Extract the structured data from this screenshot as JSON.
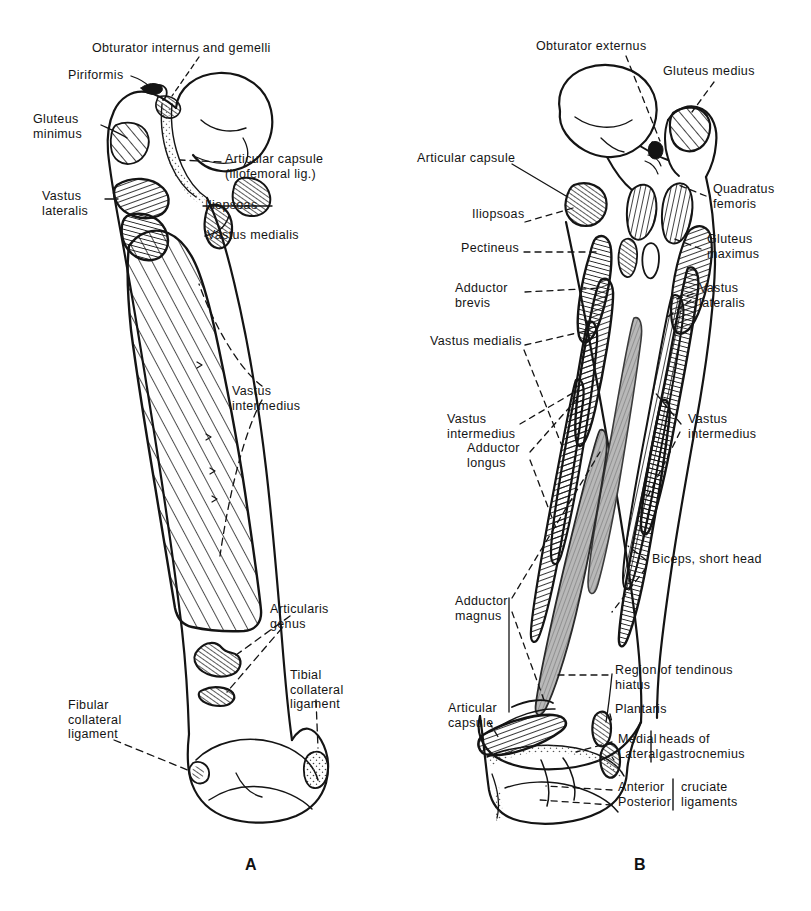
{
  "figure": {
    "panels": [
      {
        "id": "A",
        "label": "A",
        "view": "anterior"
      },
      {
        "id": "B",
        "label": "B",
        "view": "posterior"
      }
    ]
  },
  "panel_a": {
    "label": "A",
    "labels": [
      {
        "name": "obturator-internus-and-gemelli",
        "text": "Obturator internus and gemelli",
        "x": 92,
        "y": 47,
        "align": "left"
      },
      {
        "name": "piriformis",
        "text": "Piriformis",
        "x": 68,
        "y": 74,
        "align": "left"
      },
      {
        "name": "gluteus-minimus",
        "text": "Gluteus\nminimus",
        "x": 33,
        "y": 118,
        "align": "left"
      },
      {
        "name": "articular-capsule-iliofemoral",
        "text": "Articular capsule\n(iliofemoral lig.)",
        "x": 225,
        "y": 158,
        "align": "left"
      },
      {
        "name": "vastus-lateralis",
        "text": "Vastus\nlateralis",
        "x": 42,
        "y": 193,
        "align": "left"
      },
      {
        "name": "iliopsoas",
        "text": "Iliopsoas",
        "x": 205,
        "y": 202,
        "align": "left"
      },
      {
        "name": "vastus-medialis",
        "text": "Vastus medialis",
        "x": 207,
        "y": 232,
        "align": "left"
      },
      {
        "name": "vastus-intermedius",
        "text": "Vastus\nintermedius",
        "x": 232,
        "y": 390,
        "align": "left"
      },
      {
        "name": "articularis-genus",
        "text": "Articularis\ngenus",
        "x": 270,
        "y": 608,
        "align": "left"
      },
      {
        "name": "tibial-collateral-ligament",
        "text": "Tibial\ncollateral\nligament",
        "x": 290,
        "y": 674,
        "align": "left"
      },
      {
        "name": "fibular-collateral-ligament",
        "text": "Fibular\ncollateral\nligament",
        "x": 68,
        "y": 704,
        "align": "left"
      }
    ]
  },
  "panel_b": {
    "label": "B",
    "labels": [
      {
        "name": "obturator-externus",
        "text": "Obturator externus",
        "x": 536,
        "y": 45,
        "align": "left"
      },
      {
        "name": "gluteus-medius",
        "text": "Gluteus medius",
        "x": 663,
        "y": 70,
        "align": "left"
      },
      {
        "name": "articular-capsule-top",
        "text": "Articular capsule",
        "x": 417,
        "y": 157,
        "align": "left"
      },
      {
        "name": "quadratus-femoris",
        "text": "Quadratus\nfemoris",
        "x": 713,
        "y": 188,
        "align": "left"
      },
      {
        "name": "iliopsoas",
        "text": "Iliopsoas",
        "x": 472,
        "y": 213,
        "align": "left"
      },
      {
        "name": "gluteus-maximus",
        "text": "Gluteus\nmaximus",
        "x": 707,
        "y": 238,
        "align": "left"
      },
      {
        "name": "pectineus",
        "text": "Pectineus",
        "x": 461,
        "y": 247,
        "align": "left"
      },
      {
        "name": "adductor-brevis",
        "text": "Adductor\nbrevis",
        "x": 455,
        "y": 287,
        "align": "left"
      },
      {
        "name": "vastus-lateralis",
        "text": "Vastus\nlateralis",
        "x": 699,
        "y": 287,
        "align": "left"
      },
      {
        "name": "vastus-medialis",
        "text": "Vastus medialis",
        "x": 430,
        "y": 340,
        "align": "left"
      },
      {
        "name": "vastus-intermedius-left",
        "text": "Vastus\nintermedius",
        "x": 447,
        "y": 418,
        "align": "left"
      },
      {
        "name": "vastus-intermedius-right",
        "text": "Vastus\nintermedius",
        "x": 688,
        "y": 418,
        "align": "left"
      },
      {
        "name": "adductor-longus",
        "text": "Adductor\nlongus",
        "x": 467,
        "y": 447,
        "align": "left"
      },
      {
        "name": "biceps-short-head",
        "text": "Biceps, short head",
        "x": 652,
        "y": 558,
        "align": "left"
      },
      {
        "name": "adductor-magnus",
        "text": "Adductor\nmagnus",
        "x": 455,
        "y": 600,
        "align": "left"
      },
      {
        "name": "region-of-tendinous-hiatus",
        "text": "Region of tendinous\nhiatus",
        "x": 615,
        "y": 669,
        "align": "left"
      },
      {
        "name": "plantaris",
        "text": "Plantaris",
        "x": 615,
        "y": 708,
        "align": "left"
      },
      {
        "name": "articular-capsule-bottom",
        "text": "Articular\ncapsule",
        "x": 448,
        "y": 707,
        "align": "left"
      },
      {
        "name": "medial-head",
        "text": "Medial",
        "x": 618,
        "y": 738,
        "align": "left"
      },
      {
        "name": "lateral-head",
        "text": "Lateral",
        "x": 618,
        "y": 753,
        "align": "left"
      },
      {
        "name": "heads-of-gastrocnemius",
        "text": "heads of\ngastrocnemius",
        "x": 659,
        "y": 738,
        "align": "left"
      },
      {
        "name": "anterior-cruciate",
        "text": "Anterior",
        "x": 618,
        "y": 786,
        "align": "left"
      },
      {
        "name": "posterior-cruciate",
        "text": "Posterior",
        "x": 618,
        "y": 801,
        "align": "left"
      },
      {
        "name": "cruciate-ligaments",
        "text": "cruciate\nligaments",
        "x": 681,
        "y": 786,
        "align": "left"
      }
    ]
  },
  "figure_labels": [
    {
      "name": "figure-label-a",
      "text": "A",
      "x": 245,
      "y": 856
    },
    {
      "name": "figure-label-b",
      "text": "B",
      "x": 634,
      "y": 856
    }
  ],
  "colors": {
    "background": "#ffffff",
    "ink": "#141414",
    "hatch": "#1a1a1a",
    "stipple": "#555555"
  }
}
